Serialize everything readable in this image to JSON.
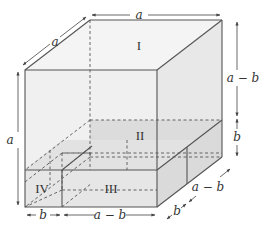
{
  "diagram": {
    "type": "3D cube decomposition (a^3 - b^3 factorization)",
    "colors": {
      "edge": "#555555",
      "dim": "#444444",
      "face_light": "#f2f2f2",
      "face_shade": "#e6e6e6",
      "slab_shade": "#d9d9d9",
      "text": "#333333"
    },
    "regions": [
      {
        "id": "I",
        "label": "I"
      },
      {
        "id": "II",
        "label": "II"
      },
      {
        "id": "III",
        "label": "III"
      },
      {
        "id": "IV",
        "label": "IV"
      }
    ],
    "dimensions": {
      "top_depth": "a",
      "top_width": "a",
      "left_height": "a",
      "right_upper": "a − b",
      "right_lower": "b",
      "bottom_left": "b",
      "bottom_right": "a − b",
      "diag_front": "b",
      "diag_back": "a − b"
    }
  }
}
